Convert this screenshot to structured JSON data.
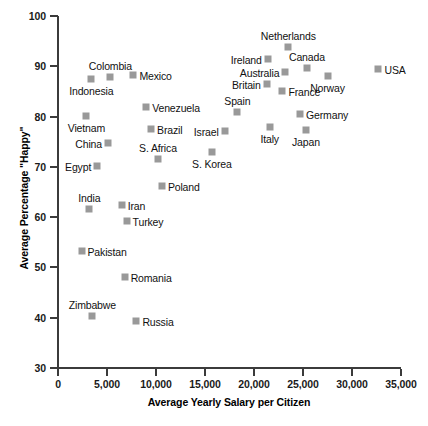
{
  "chart_data": {
    "type": "scatter",
    "title": "",
    "xlabel": "Average Yearly Salary per Citizen",
    "ylabel": "Average Percentage \"Happy\"",
    "xlim": [
      0,
      35000
    ],
    "ylim": [
      30,
      100
    ],
    "xticks": [
      0,
      5000,
      10000,
      15000,
      20000,
      25000,
      30000,
      35000
    ],
    "xticklabels": [
      "0",
      "5,000",
      "10,000",
      "15,000",
      "20,000",
      "25,000",
      "30,000",
      "35,000"
    ],
    "yticks": [
      30,
      40,
      50,
      60,
      70,
      80,
      90,
      100
    ],
    "yticklabels": [
      "30",
      "40",
      "50",
      "60",
      "70",
      "80",
      "90",
      "100"
    ],
    "grid": false,
    "legend": false,
    "marker_color": "#999999",
    "axis_color": "#3b3b3b",
    "points": [
      {
        "label": "Indonesia",
        "x": 3400,
        "y": 87.5,
        "label_pos": "below"
      },
      {
        "label": "Colombia",
        "x": 5350,
        "y": 87.9,
        "label_pos": "above"
      },
      {
        "label": "Mexico",
        "x": 7700,
        "y": 88.2,
        "label_pos": "right"
      },
      {
        "label": "Netherlands",
        "x": 23500,
        "y": 93.8,
        "label_pos": "above"
      },
      {
        "label": "Ireland",
        "x": 21400,
        "y": 91.5,
        "label_pos": "left"
      },
      {
        "label": "Canada",
        "x": 25400,
        "y": 89.7,
        "label_pos": "above"
      },
      {
        "label": "Australia",
        "x": 23200,
        "y": 88.9,
        "label_pos": "left"
      },
      {
        "label": "USA",
        "x": 32700,
        "y": 89.5,
        "label_pos": "right"
      },
      {
        "label": "Norway",
        "x": 27500,
        "y": 88.0,
        "label_pos": "below"
      },
      {
        "label": "Britain",
        "x": 21300,
        "y": 86.5,
        "label_pos": "left"
      },
      {
        "label": "France",
        "x": 22900,
        "y": 85.0,
        "label_pos": "right"
      },
      {
        "label": "Venezuela",
        "x": 9000,
        "y": 82.0,
        "label_pos": "right"
      },
      {
        "label": "Spain",
        "x": 18300,
        "y": 81.0,
        "label_pos": "above"
      },
      {
        "label": "Germany",
        "x": 24700,
        "y": 80.6,
        "label_pos": "right"
      },
      {
        "label": "Vietnam",
        "x": 2900,
        "y": 80.2,
        "label_pos": "below"
      },
      {
        "label": "Brazil",
        "x": 9500,
        "y": 77.6,
        "label_pos": "right"
      },
      {
        "label": "Israel",
        "x": 17000,
        "y": 77.2,
        "label_pos": "left"
      },
      {
        "label": "Italy",
        "x": 21600,
        "y": 77.9,
        "label_pos": "below"
      },
      {
        "label": "Japan",
        "x": 25300,
        "y": 77.3,
        "label_pos": "below"
      },
      {
        "label": "China",
        "x": 5100,
        "y": 74.8,
        "label_pos": "left"
      },
      {
        "label": "S. Africa",
        "x": 10200,
        "y": 71.5,
        "label_pos": "above"
      },
      {
        "label": "S. Korea",
        "x": 15700,
        "y": 73.0,
        "label_pos": "below"
      },
      {
        "label": "Egypt",
        "x": 4000,
        "y": 70.2,
        "label_pos": "left"
      },
      {
        "label": "Poland",
        "x": 10600,
        "y": 66.2,
        "label_pos": "right"
      },
      {
        "label": "India",
        "x": 3200,
        "y": 61.6,
        "label_pos": "above"
      },
      {
        "label": "Iran",
        "x": 6500,
        "y": 62.4,
        "label_pos": "right"
      },
      {
        "label": "Turkey",
        "x": 7000,
        "y": 59.2,
        "label_pos": "right"
      },
      {
        "label": "Pakistan",
        "x": 2400,
        "y": 53.2,
        "label_pos": "right"
      },
      {
        "label": "Romania",
        "x": 6800,
        "y": 48.0,
        "label_pos": "right"
      },
      {
        "label": "Zimbabwe",
        "x": 3500,
        "y": 40.4,
        "label_pos": "above"
      },
      {
        "label": "Russia",
        "x": 8000,
        "y": 39.3,
        "label_pos": "right"
      }
    ]
  }
}
